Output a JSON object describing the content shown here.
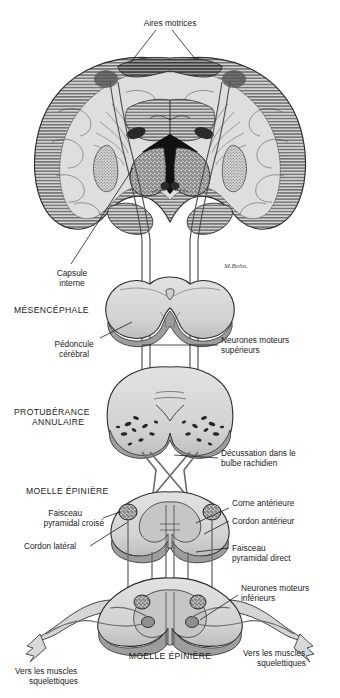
{
  "figure": {
    "signature": "M.Bohn.",
    "palette": {
      "ink": "#1a1a1a",
      "outline": "#2b2b2b",
      "tissue_light": "#d9d9d9",
      "tissue_mid": "#bdbdbd",
      "tissue_dark": "#9a9a9a",
      "cortex_hatch": "#6e6e6e",
      "motor_area": "#6a6a6a",
      "nucleus_dark": "#1c1c1c",
      "tract_line": "#555555",
      "background": "#ffffff"
    }
  },
  "labels": {
    "aires_motrices": "Aires motrices",
    "capsule_interne": "Capsule\ninterne",
    "capsule_interne_l1": "Capsule",
    "capsule_interne_l2": "interne",
    "mesencephale": "MÉSENCÉPHALE",
    "pedoncule_l1": "Pédoncule",
    "pedoncule_l2": "cérébral",
    "neurones_sup_l1": "Neurones moteurs",
    "neurones_sup_l2": "supérieurs",
    "protuberance_l1": "PROTUBÉRANCE",
    "protuberance_l2": "ANNULAIRE",
    "decussation_l1": "Décussation dans le",
    "decussation_l2": "bulbe rachidien",
    "moelle_epiniere_haut": "MOELLE ÉPINIÈRE",
    "faisceau_croise_l1": "Faisceau",
    "faisceau_croise_l2": "pyramidal croisé",
    "cordon_lateral": "Cordon latéral",
    "corne_anterieure": "Corne antérieure",
    "cordon_anterieur": "Cordon antérieur",
    "faisceau_direct_l1": "Faisceau",
    "faisceau_direct_l2": "pyramidal direct",
    "neurones_inf_l1": "Neurones moteurs",
    "neurones_inf_l2": "inférieurs",
    "moelle_epiniere_bas": "MOELLE ÉPINIÈRE",
    "muscles_gauche_l1": "Vers les muscles",
    "muscles_gauche_l2": "squelettiques",
    "muscles_droite_l1": "Vers les muscles",
    "muscles_droite_l2": "squelettiques"
  },
  "structures": [
    {
      "name": "cerebral-hemispheres-coronal-section",
      "region": "top"
    },
    {
      "name": "motor-cortex-areas",
      "region": "top"
    },
    {
      "name": "internal-capsule",
      "region": "top"
    },
    {
      "name": "basal-ganglia-thalamus",
      "region": "top"
    },
    {
      "name": "midbrain-mesencephalon",
      "region": "upper-middle"
    },
    {
      "name": "cerebral-peduncle",
      "region": "upper-middle"
    },
    {
      "name": "pons-protuberance",
      "region": "middle"
    },
    {
      "name": "medullary-pyramidal-decussation",
      "region": "lower-middle"
    },
    {
      "name": "spinal-cord-upper",
      "region": "lower"
    },
    {
      "name": "spinal-cord-lower",
      "region": "bottom"
    },
    {
      "name": "lower-motor-neuron-roots",
      "region": "bottom"
    },
    {
      "name": "skeletal-muscle-arrows",
      "region": "bottom"
    }
  ]
}
